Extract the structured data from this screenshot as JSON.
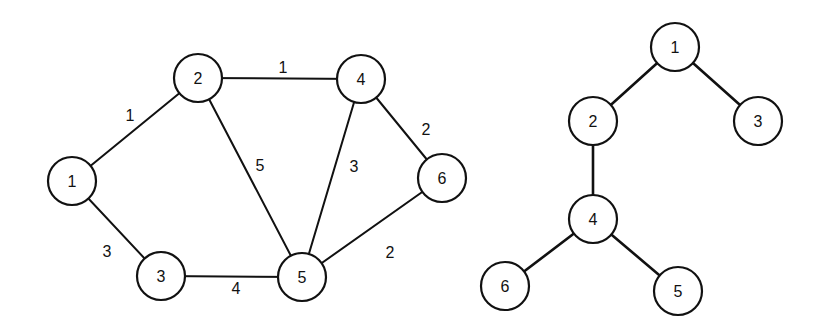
{
  "graph": {
    "nodes": [
      {
        "id": "1",
        "label": "1",
        "x": 72,
        "y": 181
      },
      {
        "id": "2",
        "label": "2",
        "x": 198,
        "y": 78
      },
      {
        "id": "3",
        "label": "3",
        "x": 161,
        "y": 276
      },
      {
        "id": "4",
        "label": "4",
        "x": 361,
        "y": 79
      },
      {
        "id": "5",
        "label": "5",
        "x": 302,
        "y": 277
      },
      {
        "id": "6",
        "label": "6",
        "x": 442,
        "y": 178
      }
    ],
    "edges": [
      {
        "from": "1",
        "to": "2",
        "weight": "1",
        "lx": 130,
        "ly": 115
      },
      {
        "from": "2",
        "to": "4",
        "weight": "1",
        "lx": 283,
        "ly": 67
      },
      {
        "from": "2",
        "to": "5",
        "weight": "5",
        "lx": 260,
        "ly": 165
      },
      {
        "from": "1",
        "to": "3",
        "weight": "3",
        "lx": 107,
        "ly": 251
      },
      {
        "from": "3",
        "to": "5",
        "weight": "4",
        "lx": 236,
        "ly": 288
      },
      {
        "from": "4",
        "to": "5",
        "weight": "3",
        "lx": 354,
        "ly": 166
      },
      {
        "from": "4",
        "to": "6",
        "weight": "2",
        "lx": 426,
        "ly": 129
      },
      {
        "from": "6",
        "to": "5",
        "weight": "2",
        "lx": 390,
        "ly": 252
      }
    ]
  },
  "tree": {
    "nodes": [
      {
        "id": "1",
        "label": "1",
        "x": 675,
        "y": 47
      },
      {
        "id": "2",
        "label": "2",
        "x": 593,
        "y": 121
      },
      {
        "id": "3",
        "label": "3",
        "x": 758,
        "y": 121
      },
      {
        "id": "4",
        "label": "4",
        "x": 593,
        "y": 219
      },
      {
        "id": "6",
        "label": "6",
        "x": 505,
        "y": 286
      },
      {
        "id": "5",
        "label": "5",
        "x": 678,
        "y": 291
      }
    ],
    "edges": [
      {
        "from": "1",
        "to": "2"
      },
      {
        "from": "1",
        "to": "3"
      },
      {
        "from": "2",
        "to": "4"
      },
      {
        "from": "4",
        "to": "6"
      },
      {
        "from": "4",
        "to": "5"
      }
    ]
  },
  "style": {
    "node_radius": 24,
    "stroke": "#111111",
    "background": "#ffffff"
  }
}
